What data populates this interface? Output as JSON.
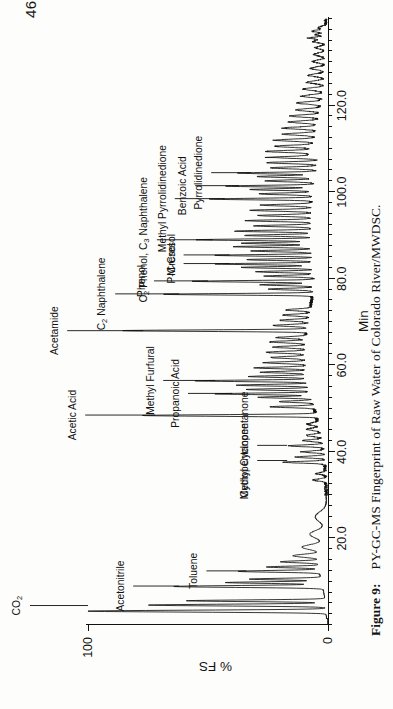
{
  "document": {
    "number": "4636449"
  },
  "caption": {
    "figure_label": "Figure  9:",
    "text": "PY-GC-MS Fingerprint of Raw Water of Colorado River/MWDSC."
  },
  "chart_data": {
    "type": "line",
    "title": "PY-GC-MS Fingerprint of Raw Water of Colorado River/MWDSC.",
    "xlabel": "Min",
    "ylabel": "% FS",
    "xlim": [
      0,
      140
    ],
    "ylim": [
      0,
      100
    ],
    "grid": false,
    "legend": "none",
    "orientation": "rotated-90",
    "xticks": [
      20.0,
      40.0,
      60.0,
      80.0,
      100.0,
      120.0
    ],
    "xticklabels": [
      "20.0",
      "40.0",
      "60.0",
      "80.0",
      "100.0",
      "120.0"
    ],
    "xminor_tick_step": 2.5,
    "yticks": [
      0,
      100
    ],
    "yticklabels": [
      "0",
      "100"
    ],
    "series_name": "Total ion chromatogram",
    "annotations": [
      {
        "label": "CO2",
        "html": "CO<sub>2</sub>",
        "x": 4.5,
        "y": 100
      },
      {
        "label": "Acetonitrile",
        "html": "Acetonitrile",
        "x": 9.0,
        "y": 62
      },
      {
        "label": "Toluene",
        "html": "Toluene",
        "x": 12.5,
        "y": 34
      },
      {
        "label": "Cyclopentanone",
        "html": "Cyclopentanone",
        "x": 38.0,
        "y": 17
      },
      {
        "label": "Methyl Cyclopentanone",
        "html": "Methyl Cyclopentanone",
        "x": 41.5,
        "y": 17
      },
      {
        "label": "Acetic Acid",
        "html": "Acetic Acid",
        "x": 48.5,
        "y": 72
      },
      {
        "label": "Propanoic Acid",
        "html": "Propanoic Acid",
        "x": 53.5,
        "y": 40
      },
      {
        "label": "Methyl Furfural",
        "html": "Methyl Furfural",
        "x": 56.5,
        "y": 47
      },
      {
        "label": "Acetamide",
        "html": "Acetamide",
        "x": 68.0,
        "y": 77
      },
      {
        "label": "C2 Naphthalene",
        "html": "C<sub>2</sub> Naphthalene",
        "x": 76.5,
        "y": 62
      },
      {
        "label": "Phenol",
        "html": "Phenol",
        "x": 79.5,
        "y": 50
      },
      {
        "label": "P-Cresol",
        "html": "P-Cresol",
        "x": 83.5,
        "y": 41
      },
      {
        "label": "M-Cresol",
        "html": "M-Cresol",
        "x": 85.5,
        "y": 41
      },
      {
        "label": "C2 Phenol, C3 Naphthalene",
        "html": "C<sub>2</sub> Phenol, C<sub>3</sub> Naphthalene",
        "x": 89.0,
        "y": 48
      },
      {
        "label": "Methyl Pyrrolidinedione",
        "html": "Methyl Pyrrolidinedione",
        "x": 98.5,
        "y": 43
      },
      {
        "label": "Benzoic Acid",
        "html": "Benzoic Acid",
        "x": 101.5,
        "y": 37
      },
      {
        "label": "Pyrrolidinedione",
        "html": "Pyrrolidinedione",
        "x": 104.5,
        "y": 32
      }
    ]
  }
}
